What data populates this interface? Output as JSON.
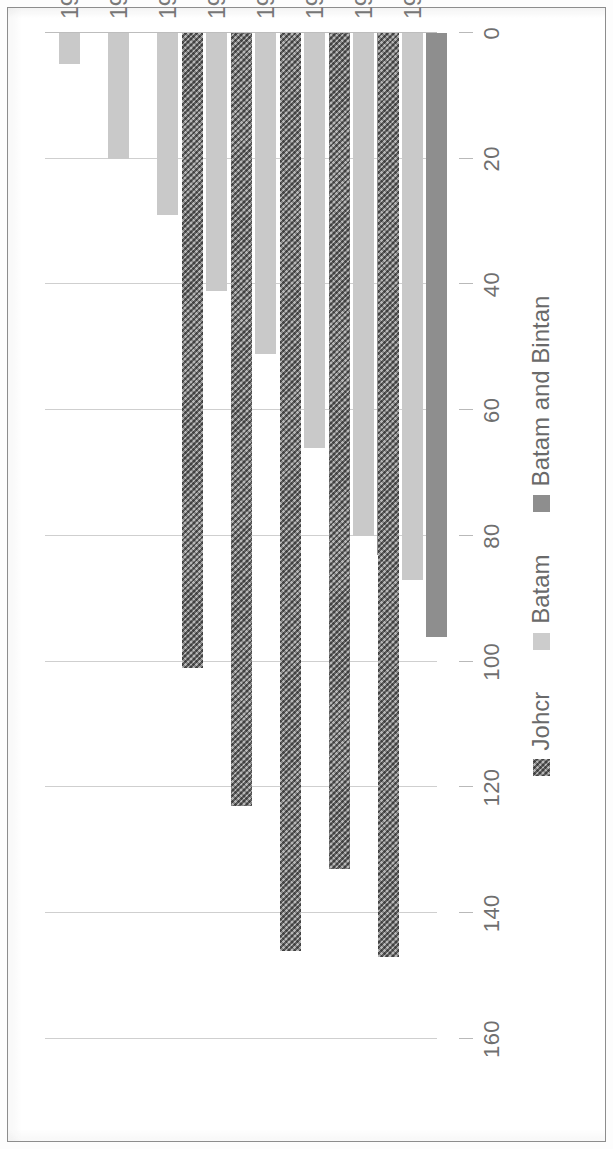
{
  "chart_data": {
    "type": "bar",
    "orientation": "vertical-rotated",
    "title": "",
    "xlabel": "",
    "ylabel": "",
    "categories": [
      "1990",
      "1991",
      "1992",
      "1993",
      "1994",
      "1995",
      "1996",
      "1997"
    ],
    "series": [
      {
        "name": "Johcr",
        "color": "#8a8a8a",
        "values": [
          0,
          0,
          0,
          101,
          123,
          146,
          133,
          147
        ]
      },
      {
        "name": "Batam",
        "color": "#c9c9c9",
        "values": [
          5,
          20,
          29,
          41,
          51,
          66,
          80,
          87
        ]
      },
      {
        "name": "Batam and Bintan",
        "color": "#8e8e8e",
        "values": [
          0,
          0,
          0,
          0,
          0,
          0,
          83,
          96
        ]
      }
    ],
    "ylim": [
      0,
      160
    ],
    "yticks": [
      0,
      20,
      40,
      60,
      80,
      100,
      120,
      140,
      160
    ],
    "ytick_labels": [
      "0",
      "20",
      "40",
      "60",
      "80",
      "100",
      "120",
      "140",
      "160"
    ],
    "grid": true,
    "legend_position": "bottom"
  },
  "legend": {
    "items": [
      {
        "label": "Johcr",
        "swatch": "johor-swatch-icon"
      },
      {
        "label": "Batam",
        "swatch": "batam-swatch-icon"
      },
      {
        "label": "Batam and Bintan",
        "swatch": "batam-bintan-swatch-icon"
      }
    ]
  }
}
